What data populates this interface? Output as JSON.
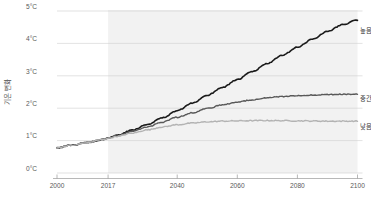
{
  "chart_data": {
    "type": "line",
    "title": "",
    "subtitle": "",
    "xlabel": "",
    "ylabel": "기온 변화",
    "xlim": [
      2000,
      2100
    ],
    "ylim": [
      0,
      5
    ],
    "grid": true,
    "legend_position": "right-inline",
    "x_ticks": [
      "2000",
      "2017",
      "2040",
      "2060",
      "2080",
      "2100"
    ],
    "x_tick_values": [
      2000,
      2017,
      2040,
      2060,
      2080,
      2100
    ],
    "y_ticks": [
      "0°C",
      "1°C",
      "2°C",
      "3°C",
      "4°C",
      "5°C"
    ],
    "y_tick_values": [
      0,
      1,
      2,
      3,
      4,
      5
    ],
    "annotations": [
      {
        "name": "projection-shading",
        "type": "vspan",
        "from": 2017,
        "to": 2100,
        "color": "#f2f2f2",
        "label": ""
      }
    ],
    "x": [
      2000,
      2005,
      2010,
      2015,
      2017,
      2020,
      2025,
      2030,
      2035,
      2040,
      2045,
      2050,
      2055,
      2060,
      2065,
      2070,
      2075,
      2080,
      2085,
      2090,
      2095,
      2100
    ],
    "series": [
      {
        "name": "높음",
        "label": "높음",
        "color": "#1a1a1a",
        "width": 1.6,
        "values": [
          0.78,
          0.86,
          0.94,
          1.03,
          1.08,
          1.16,
          1.32,
          1.5,
          1.7,
          1.92,
          2.15,
          2.4,
          2.64,
          2.88,
          3.13,
          3.38,
          3.63,
          3.88,
          4.13,
          4.37,
          4.58,
          4.72
        ]
      },
      {
        "name": "중간",
        "label": "중간",
        "color": "#595959",
        "width": 1.4,
        "values": [
          0.78,
          0.86,
          0.94,
          1.03,
          1.08,
          1.15,
          1.28,
          1.42,
          1.57,
          1.72,
          1.86,
          1.99,
          2.1,
          2.19,
          2.26,
          2.32,
          2.36,
          2.39,
          2.41,
          2.42,
          2.43,
          2.44
        ]
      },
      {
        "name": "낮음",
        "label": "낮음",
        "color": "#b3b3b3",
        "width": 1.4,
        "values": [
          0.78,
          0.86,
          0.94,
          1.03,
          1.07,
          1.13,
          1.23,
          1.33,
          1.42,
          1.49,
          1.54,
          1.58,
          1.6,
          1.61,
          1.615,
          1.62,
          1.615,
          1.61,
          1.605,
          1.6,
          1.6,
          1.6
        ]
      }
    ]
  }
}
